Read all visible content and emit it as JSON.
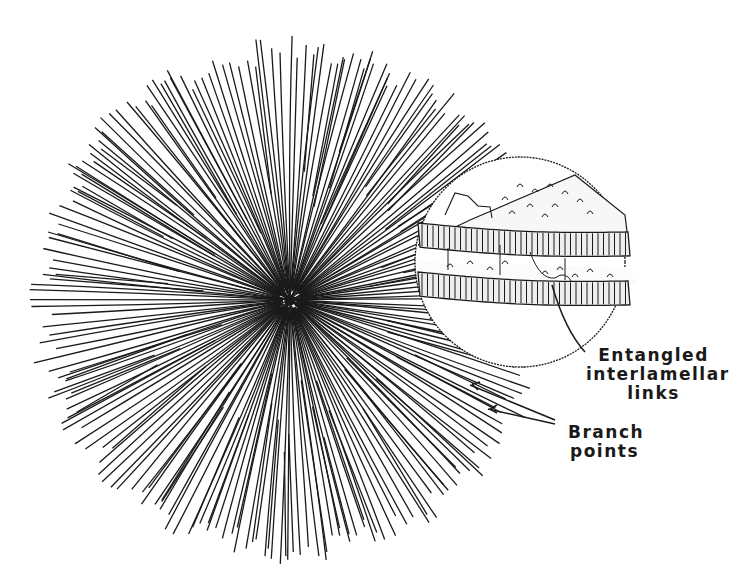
{
  "figure": {
    "type": "schematic",
    "colors": {
      "ink": "#1a1a1a",
      "background": "#ffffff"
    }
  },
  "spherulite": {
    "center": [
      290,
      300
    ],
    "radius": 265,
    "ray_count": 180
  },
  "inset": {
    "center": [
      520,
      262
    ],
    "radius": 105
  },
  "labels": {
    "entangled": [
      "Entangled",
      "interlamellar",
      "links"
    ],
    "branch": [
      "Branch",
      "points"
    ]
  }
}
